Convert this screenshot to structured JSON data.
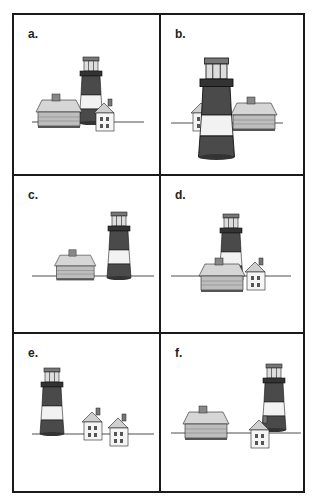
{
  "panels": [
    {
      "id": "a",
      "label": "a."
    },
    {
      "id": "b",
      "label": "b."
    },
    {
      "id": "c",
      "label": "c."
    },
    {
      "id": "d",
      "label": "d."
    },
    {
      "id": "e",
      "label": "e."
    },
    {
      "id": "f",
      "label": "f."
    }
  ],
  "colors": {
    "tower_dark": "#4a4a4a",
    "tower_light": "#f2f2f2",
    "roof": "#cfcfcf",
    "wall": "#bdbdbd",
    "house_white": "#f5f5f5",
    "line": "#1a1a1a"
  }
}
